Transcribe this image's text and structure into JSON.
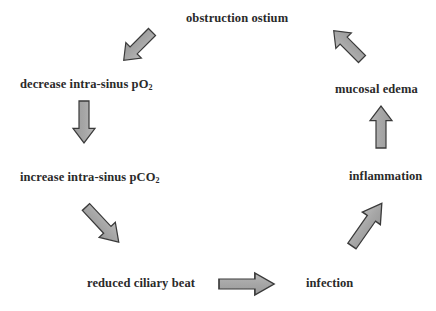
{
  "diagram": {
    "type": "cycle",
    "nodes": [
      {
        "id": "obstruction",
        "text": "obstruction ostium",
        "sub": ""
      },
      {
        "id": "decrease_po2",
        "text": "decrease intra-sinus pO",
        "sub": "2"
      },
      {
        "id": "increase_pco2",
        "text": "increase intra-sinus pCO",
        "sub": "2"
      },
      {
        "id": "reduced_ciliary",
        "text": "reduced ciliary beat",
        "sub": ""
      },
      {
        "id": "infection",
        "text": "infection",
        "sub": ""
      },
      {
        "id": "inflammation",
        "text": "inflammation",
        "sub": ""
      },
      {
        "id": "mucosal_edema",
        "text": "mucosal edema",
        "sub": ""
      }
    ],
    "edges": [
      {
        "from": "obstruction",
        "to": "decrease_po2",
        "direction": "down-left"
      },
      {
        "from": "decrease_po2",
        "to": "increase_pco2",
        "direction": "down"
      },
      {
        "from": "increase_pco2",
        "to": "reduced_ciliary",
        "direction": "down-right"
      },
      {
        "from": "reduced_ciliary",
        "to": "infection",
        "direction": "right"
      },
      {
        "from": "infection",
        "to": "inflammation",
        "direction": "up-right"
      },
      {
        "from": "inflammation",
        "to": "mucosal_edema",
        "direction": "up"
      },
      {
        "from": "mucosal_edema",
        "to": "obstruction",
        "direction": "up-left"
      }
    ],
    "colors": {
      "arrow_fill": "#a8a8a8",
      "arrow_stroke": "#3a3a3a",
      "text": "#2a2a2a",
      "background": "#ffffff"
    }
  }
}
